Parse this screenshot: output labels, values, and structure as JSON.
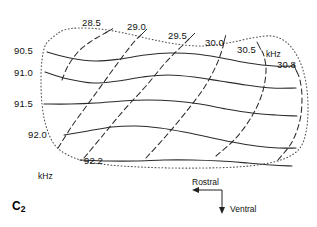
{
  "figure": {
    "panel_label_text": "C",
    "panel_label_sub": "2",
    "unit_top_right": "kHz",
    "unit_bottom_left": "kHz"
  },
  "orientation": {
    "rostral_label": "Rostral",
    "ventral_label": "Ventral"
  },
  "labels_solid_family": [
    {
      "text": "90.5",
      "x": 14,
      "y": 46
    },
    {
      "text": "91.0",
      "x": 14,
      "y": 68
    },
    {
      "text": "91.5",
      "x": 14,
      "y": 99
    },
    {
      "text": "92.0",
      "x": 28,
      "y": 130
    },
    {
      "text": "92.2",
      "x": 84,
      "y": 156
    }
  ],
  "labels_dashed_family": [
    {
      "text": "28.5",
      "x": 82,
      "y": 18
    },
    {
      "text": "29.0",
      "x": 127,
      "y": 22
    },
    {
      "text": "29.5",
      "x": 168,
      "y": 31
    },
    {
      "text": "30.0",
      "x": 205,
      "y": 38
    },
    {
      "text": "30.5",
      "x": 237,
      "y": 45
    },
    {
      "text": "30.8",
      "x": 277,
      "y": 60
    }
  ],
  "unit_labels": [
    {
      "text": "kHz",
      "x": 266,
      "y": 50
    },
    {
      "text": "kHz",
      "x": 38,
      "y": 172
    }
  ],
  "colors": {
    "line": "#2b2b2b",
    "boundary": "#555555",
    "background": "#ffffff",
    "text": "#111111"
  },
  "chart_data": {
    "type": "line",
    "title": "",
    "subtitle": "",
    "xlabel": "",
    "ylabel": "",
    "grid": false,
    "legend_position": "none",
    "axes": {
      "solid_family_unit": "kHz",
      "solid_family_values": [
        90.5,
        91.0,
        91.5,
        92.0,
        92.2
      ],
      "dashed_family_unit": "kHz",
      "dashed_family_values": [
        28.5,
        29.0,
        29.5,
        30.0,
        30.5,
        30.8
      ]
    },
    "series": [
      {
        "name": "90.5",
        "style": "solid",
        "unit": "kHz",
        "points": [
          [
            47,
            52
          ],
          [
            70,
            58
          ],
          [
            95,
            61
          ],
          [
            120,
            59
          ],
          [
            145,
            55
          ],
          [
            170,
            53
          ],
          [
            196,
            54
          ],
          [
            222,
            58
          ],
          [
            248,
            63
          ],
          [
            274,
            66
          ],
          [
            295,
            66
          ]
        ]
      },
      {
        "name": "91.0",
        "style": "solid",
        "unit": "kHz",
        "points": [
          [
            45,
            72
          ],
          [
            68,
            79
          ],
          [
            93,
            83
          ],
          [
            118,
            81
          ],
          [
            143,
            77
          ],
          [
            168,
            75
          ],
          [
            194,
            77
          ],
          [
            220,
            81
          ],
          [
            246,
            85
          ],
          [
            272,
            88
          ],
          [
            296,
            88
          ]
        ]
      },
      {
        "name": "91.5",
        "style": "solid",
        "unit": "kHz",
        "points": [
          [
            44,
            104
          ],
          [
            70,
            104
          ],
          [
            96,
            103
          ],
          [
            122,
            101
          ],
          [
            148,
            100
          ],
          [
            174,
            101
          ],
          [
            200,
            104
          ],
          [
            226,
            109
          ],
          [
            252,
            113
          ],
          [
            276,
            115
          ],
          [
            297,
            116
          ]
        ]
      },
      {
        "name": "92.0",
        "style": "solid",
        "unit": "kHz",
        "points": [
          [
            64,
            135
          ],
          [
            88,
            131
          ],
          [
            112,
            127
          ],
          [
            136,
            126
          ],
          [
            160,
            128
          ],
          [
            184,
            132
          ],
          [
            208,
            137
          ],
          [
            232,
            142
          ],
          [
            256,
            146
          ],
          [
            278,
            148
          ],
          [
            296,
            148
          ]
        ]
      },
      {
        "name": "92.2",
        "style": "solid",
        "unit": "kHz",
        "points": [
          [
            80,
            160
          ],
          [
            108,
            161
          ],
          [
            136,
            161
          ],
          [
            164,
            160
          ],
          [
            192,
            160
          ],
          [
            220,
            161
          ],
          [
            248,
            163
          ],
          [
            272,
            165
          ],
          [
            292,
            166
          ]
        ]
      },
      {
        "name": "28.5",
        "style": "dashed",
        "unit": "kHz",
        "points": [
          [
            62,
            80
          ],
          [
            68,
            66
          ],
          [
            78,
            52
          ],
          [
            90,
            42
          ],
          [
            100,
            36
          ],
          [
            107,
            32
          ]
        ]
      },
      {
        "name": "29.0",
        "style": "dashed",
        "unit": "kHz",
        "points": [
          [
            58,
            148
          ],
          [
            72,
            126
          ],
          [
            88,
            104
          ],
          [
            104,
            82
          ],
          [
            120,
            60
          ],
          [
            134,
            42
          ],
          [
            142,
            34
          ]
        ]
      },
      {
        "name": "29.5",
        "style": "dashed",
        "unit": "kHz",
        "points": [
          [
            84,
            158
          ],
          [
            104,
            134
          ],
          [
            124,
            110
          ],
          [
            146,
            86
          ],
          [
            166,
            62
          ],
          [
            182,
            46
          ],
          [
            190,
            38
          ]
        ]
      },
      {
        "name": "30.0",
        "style": "dashed",
        "unit": "kHz",
        "points": [
          [
            146,
            158
          ],
          [
            166,
            136
          ],
          [
            186,
            112
          ],
          [
            204,
            88
          ],
          [
            216,
            66
          ],
          [
            222,
            50
          ],
          [
            224,
            42
          ]
        ]
      },
      {
        "name": "30.5",
        "style": "dashed",
        "unit": "kHz",
        "points": [
          [
            216,
            156
          ],
          [
            236,
            138
          ],
          [
            252,
            116
          ],
          [
            262,
            94
          ],
          [
            266,
            72
          ],
          [
            264,
            56
          ],
          [
            260,
            48
          ]
        ]
      },
      {
        "name": "30.8",
        "style": "dashed",
        "unit": "kHz",
        "points": [
          [
            278,
            160
          ],
          [
            292,
            142
          ],
          [
            300,
            120
          ],
          [
            302,
            98
          ],
          [
            300,
            80
          ],
          [
            296,
            70
          ]
        ]
      }
    ],
    "boundary": {
      "style": "dotted",
      "points": [
        [
          57,
          34
        ],
        [
          46,
          44
        ],
        [
          42,
          60
        ],
        [
          41,
          80
        ],
        [
          42,
          104
        ],
        [
          46,
          126
        ],
        [
          54,
          144
        ],
        [
          66,
          154
        ],
        [
          84,
          161
        ],
        [
          110,
          165
        ],
        [
          140,
          167
        ],
        [
          172,
          168
        ],
        [
          204,
          168
        ],
        [
          236,
          167
        ],
        [
          264,
          164
        ],
        [
          286,
          158
        ],
        [
          300,
          148
        ],
        [
          306,
          132
        ],
        [
          308,
          112
        ],
        [
          307,
          90
        ],
        [
          303,
          70
        ],
        [
          296,
          54
        ],
        [
          286,
          42
        ],
        [
          272,
          36
        ],
        [
          252,
          38
        ],
        [
          228,
          43
        ],
        [
          202,
          46
        ],
        [
          176,
          44
        ],
        [
          150,
          39
        ],
        [
          124,
          33
        ],
        [
          100,
          29
        ],
        [
          78,
          28
        ],
        [
          64,
          30
        ],
        [
          57,
          34
        ]
      ]
    }
  }
}
